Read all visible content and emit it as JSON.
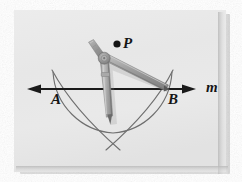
{
  "figure": {
    "caption_kind": "geometry-construction",
    "labels": {
      "point_p": "P",
      "point_a": "A",
      "point_b": "B",
      "line_m": "m"
    },
    "colors": {
      "photo_background": "#e9e9e9",
      "page_background": "#ffffff",
      "line_ink": "#1a1a1a",
      "arc_ink": "#6d6d6d",
      "compass_body": "#9b9b9b",
      "compass_shadow": "#7a7a7a",
      "compass_highlight": "#c9c9c9",
      "label_ink": "#151515",
      "edge_shadow": "#c2c2c2"
    },
    "geometry": {
      "line_m": {
        "x1": 27,
        "y1": 89,
        "x2": 196,
        "y2": 89,
        "arrow_left": true,
        "arrow_right": true
      },
      "point_p": {
        "x": 117,
        "y": 44,
        "r": 3.6
      },
      "point_a": {
        "x": 59,
        "y": 89
      },
      "point_b": {
        "x": 166,
        "y": 89
      },
      "arc_from_p": {
        "cx": 117,
        "cy": 44,
        "r": 64,
        "note": "arc centered at P cutting line m at A and B"
      },
      "arc_from_a": {
        "cx": 59,
        "cy": 89,
        "r": 66
      },
      "arc_from_b": {
        "cx": 166,
        "cy": 89,
        "r": 66
      },
      "cross_point_x": {
        "x": 113,
        "y": 140
      },
      "compass_pivot": {
        "x": 104,
        "y": 58
      },
      "compass_needle_tip": {
        "x": 110,
        "y": 123
      },
      "compass_pencil_tip": {
        "x": 166,
        "y": 89
      },
      "compass_handle_top": {
        "x": 91,
        "y": 43
      }
    }
  },
  "elements": {
    "photo_frame_name": "photograph-frame",
    "drawing_name": "compass-construction-drawing"
  }
}
